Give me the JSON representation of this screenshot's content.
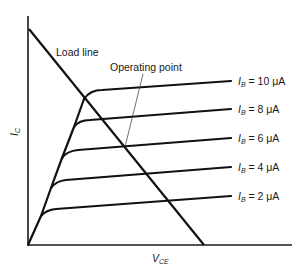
{
  "diagram": {
    "title": "",
    "type": "transistor output characteristics with load line",
    "axes": {
      "y_label_main": "I",
      "y_label_sub": "C",
      "x_label_main": "V",
      "x_label_sub": "CE"
    },
    "annotations": {
      "load_line": "Load line",
      "operating_point": "Operating point"
    },
    "curves": [
      {
        "label_main": "I",
        "label_sub": "B",
        "label_value": " = 10 μA",
        "ib_uA": 10
      },
      {
        "label_main": "I",
        "label_sub": "B",
        "label_value": " = 8 μA",
        "ib_uA": 8
      },
      {
        "label_main": "I",
        "label_sub": "B",
        "label_value": " = 6 μA",
        "ib_uA": 6
      },
      {
        "label_main": "I",
        "label_sub": "B",
        "label_value": " = 4 μA",
        "ib_uA": 4
      },
      {
        "label_main": "I",
        "label_sub": "B",
        "label_value": " = 2 μA",
        "ib_uA": 2
      }
    ],
    "operating_point_curve": "I_B = 6 μA",
    "colors": {
      "line": "#111111",
      "background": "#ffffff"
    }
  }
}
